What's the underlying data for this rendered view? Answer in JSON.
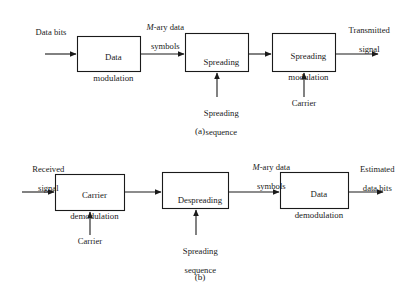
{
  "figure": {
    "type": "block-diagram",
    "title_visible": false,
    "panels": [
      {
        "id": "a",
        "caption": "(a)",
        "description": "Direct-sequence spread spectrum transmitter chain",
        "blocks": [
          {
            "id": "data-modulation",
            "line1": "Data",
            "line2": "modulation"
          },
          {
            "id": "spreading",
            "line1": "Spreading",
            "line2": ""
          },
          {
            "id": "spreading-modulation",
            "line1": "Spreading",
            "line2": "modulation"
          }
        ],
        "signal_labels": {
          "input": {
            "line1": "Data bits",
            "line2": ""
          },
          "between_1_2_pre": "M",
          "between_1_2_rest": "-ary data",
          "between_1_2_line2": "symbols",
          "output": {
            "line1": "Transmitted",
            "line2": "signal"
          }
        },
        "bottom_inputs": [
          {
            "id": "spreading-sequence",
            "line1": "Spreading",
            "line2": "sequence"
          },
          {
            "id": "carrier",
            "line1": "Carrier",
            "line2": ""
          }
        ]
      },
      {
        "id": "b",
        "caption": "(b)",
        "description": "Direct-sequence spread spectrum receiver chain",
        "blocks": [
          {
            "id": "carrier-demodulation",
            "line1": "Carrier",
            "line2": "demodulation"
          },
          {
            "id": "despreading",
            "line1": "Despreading",
            "line2": ""
          },
          {
            "id": "data-demodulation",
            "line1": "Data",
            "line2": "demodulation"
          }
        ],
        "signal_labels": {
          "input": {
            "line1": "Received",
            "line2": "signal"
          },
          "between_2_3_pre": "M",
          "between_2_3_rest": "-ary data",
          "between_2_3_line2": "symbols",
          "output": {
            "line1": "Estimated",
            "line2": "data bits"
          }
        },
        "bottom_inputs": [
          {
            "id": "carrier",
            "line1": "Carrier",
            "line2": ""
          },
          {
            "id": "spreading-sequence",
            "line1": "Spreading",
            "line2": "sequence"
          }
        ]
      }
    ],
    "colors": {
      "stroke": "#1a1a1a",
      "fill": "#ffffff",
      "background": "#ffffff"
    }
  }
}
